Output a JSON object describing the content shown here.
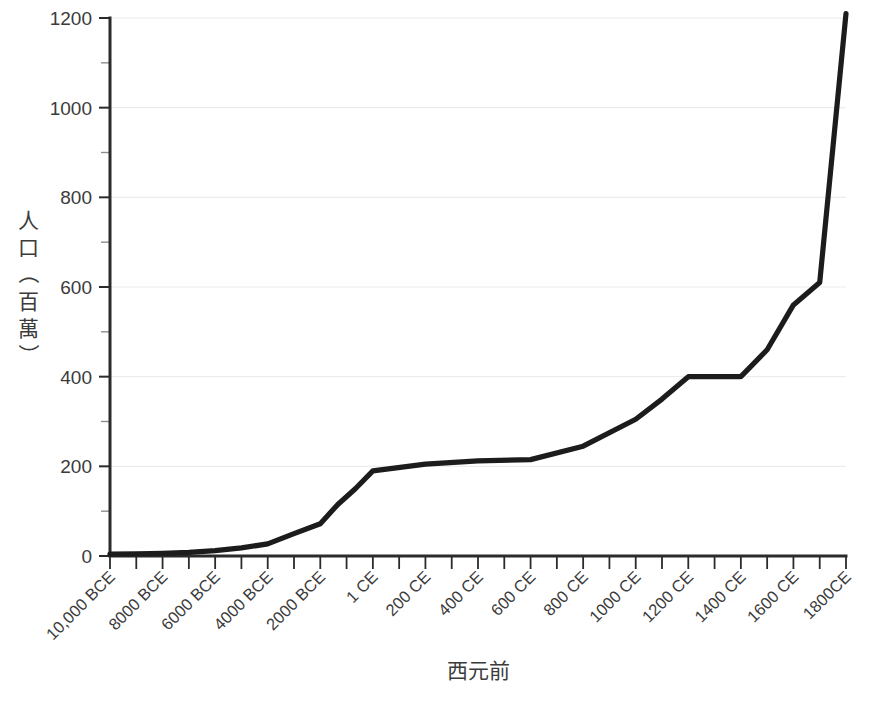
{
  "chart_data": {
    "type": "line",
    "title": "",
    "subtitle": "",
    "xlabel": "西元前",
    "ylabel": "人口（百萬）",
    "ylabel_chars": [
      "人",
      "口",
      "（",
      "百",
      "萬",
      "）"
    ],
    "grid": true,
    "grid_axis": "y",
    "legend": false,
    "legend_position": "none",
    "line_color": "#1c1c1c",
    "axis_color": "#2b2b2b",
    "grid_color": "#ececec",
    "background_color": "#ffffff",
    "ylim": [
      0,
      1200
    ],
    "yticks": [
      0,
      200,
      400,
      600,
      800,
      1000,
      1200
    ],
    "ytick_labels": [
      "0",
      "200",
      "400",
      "600",
      "800",
      "1000",
      "1200"
    ],
    "yminor_ticks": [
      100,
      300,
      500,
      700,
      900,
      1100
    ],
    "xtick_labels": [
      "10,000 BCE",
      "8000 BCE",
      "6000 BCE",
      "4000 BCE",
      "2000 BCE",
      "1 CE",
      "200 CE",
      "400 CE",
      "600 CE",
      "800 CE",
      "1000 CE",
      "1200 CE",
      "1400 CE",
      "1600 CE",
      "1800CE"
    ],
    "xtick_rotation_deg": -45,
    "x_minor_ticks_between_labels": 1,
    "x": [
      "10,000 BCE",
      "9000 BCE",
      "8000 BCE",
      "7000 BCE",
      "6000 BCE",
      "5000 BCE",
      "4000 BCE",
      "3000 BCE",
      "2000 BCE",
      "1000 BCE",
      "500 BCE",
      "1 CE",
      "200 CE",
      "400 CE",
      "600 CE",
      "800 CE",
      "1000 CE",
      "1100 CE",
      "1200 CE",
      "1300 CE",
      "1400 CE",
      "1500 CE",
      "1600 CE",
      "1700 CE",
      "1800 CE"
    ],
    "values": [
      4,
      5,
      6,
      8,
      12,
      18,
      27,
      50,
      72,
      115,
      150,
      190,
      205,
      212,
      215,
      245,
      305,
      350,
      400,
      400,
      400,
      460,
      560,
      610,
      1210
    ],
    "series": [
      {
        "name": "世界人口",
        "values": [
          4,
          5,
          6,
          8,
          12,
          18,
          27,
          50,
          72,
          115,
          150,
          190,
          205,
          212,
          215,
          245,
          305,
          350,
          400,
          400,
          400,
          460,
          560,
          610,
          1210
        ]
      }
    ],
    "annotations": []
  }
}
